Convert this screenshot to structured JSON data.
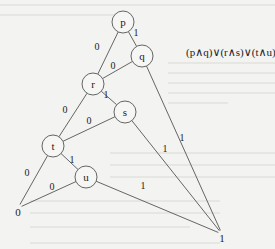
{
  "diagram": {
    "type": "binary-decision-diagram",
    "formula": "(p∧q)∨(r∧s)∨(t∧u)",
    "nodes": [
      {
        "id": "p",
        "label": "p",
        "x": 123,
        "y": 22
      },
      {
        "id": "q",
        "label": "q",
        "x": 142,
        "y": 56
      },
      {
        "id": "r",
        "label": "r",
        "x": 93,
        "y": 84
      },
      {
        "id": "s",
        "label": "s",
        "x": 125,
        "y": 112
      },
      {
        "id": "t",
        "label": "t",
        "x": 53,
        "y": 146
      },
      {
        "id": "u",
        "label": "u",
        "x": 86,
        "y": 177
      }
    ],
    "terminals": [
      {
        "id": "zero",
        "label": "0",
        "x": 18,
        "y": 212
      },
      {
        "id": "one",
        "label": "1",
        "x": 222,
        "y": 238
      }
    ],
    "edges": [
      {
        "from": "p",
        "to": "q",
        "label": "1",
        "lx": 136,
        "ly": 36
      },
      {
        "from": "p",
        "to": "r",
        "label": "0",
        "lx": 97,
        "ly": 50
      },
      {
        "from": "q",
        "to": "r",
        "label": "0",
        "lx": 113,
        "ly": 69
      },
      {
        "from": "q",
        "to": "one",
        "label": "1",
        "lx": 182,
        "ly": 141
      },
      {
        "from": "r",
        "to": "s",
        "label": "1",
        "lx": 106,
        "ly": 98
      },
      {
        "from": "r",
        "to": "t",
        "label": "0",
        "lx": 65,
        "ly": 113
      },
      {
        "from": "s",
        "to": "t",
        "label": "0",
        "lx": 89,
        "ly": 124
      },
      {
        "from": "s",
        "to": "one",
        "label": "1",
        "lx": 165,
        "ly": 152
      },
      {
        "from": "t",
        "to": "u",
        "label": "1",
        "lx": 72,
        "ly": 163
      },
      {
        "from": "t",
        "to": "zero",
        "label": "0",
        "lx": 27,
        "ly": 176
      },
      {
        "from": "u",
        "to": "zero",
        "label": "0",
        "lx": 52,
        "ly": 190
      },
      {
        "from": "u",
        "to": "one",
        "label": "1",
        "lx": 143,
        "ly": 189
      }
    ]
  }
}
